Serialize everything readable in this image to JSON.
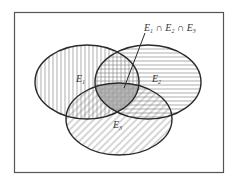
{
  "diagram": {
    "type": "venn",
    "sets": [
      {
        "id": "E1",
        "label": "E",
        "subscript": "1",
        "hatch": "vertical"
      },
      {
        "id": "E2",
        "label": "E",
        "subscript": "2",
        "hatch": "horizontal"
      },
      {
        "id": "E3",
        "label": "E",
        "subscript": "3",
        "hatch": "diagonal"
      }
    ],
    "annotation": {
      "text": "E1 ∩ E2 ∩ E3",
      "parts": [
        "E",
        "1",
        " ∩ E",
        "2",
        " ∩ E",
        "3"
      ],
      "points_to": "intersection of E1, E2 and E3"
    },
    "colors": {
      "stroke": "#2a2a2a",
      "frame": "#555555",
      "hatch": "#777777",
      "center_fill": "#9a9a9a"
    }
  }
}
